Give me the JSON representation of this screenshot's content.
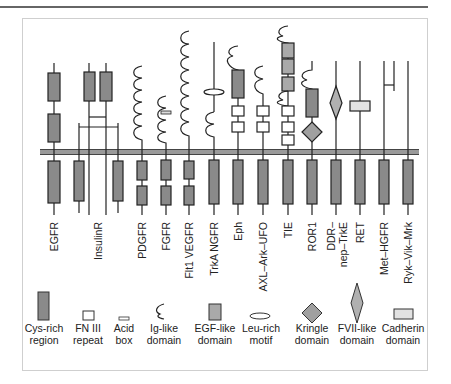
{
  "figure": {
    "title": "",
    "colors": {
      "cys_rich": "#8a8a8a",
      "egf_like": "#a9a9a9",
      "kringle": "#a0a0a0",
      "fvii_like": "#b0b0b0",
      "cadherin": "#e2e2e2",
      "membrane": "#7a7a7a",
      "line": "#222222"
    },
    "receptors": [
      {
        "name": "EGFR",
        "x": 54
      },
      {
        "name": "InsulinR",
        "x": 98
      },
      {
        "name": "PDGFR",
        "x": 142
      },
      {
        "name": "FGFR",
        "x": 166
      },
      {
        "name": "Flt1 VEGFR",
        "x": 189
      },
      {
        "name": "TrkA NGFR",
        "x": 214
      },
      {
        "name": "Eph",
        "x": 238
      },
      {
        "name": "AXL–Ark–UFO",
        "x": 263
      },
      {
        "name": "TIE",
        "x": 288
      },
      {
        "name": "ROR1",
        "x": 312
      },
      {
        "name": "DDR–\nnep–TrkE",
        "x": 336
      },
      {
        "name": "RET",
        "x": 360
      },
      {
        "name": "Met–HGFR",
        "x": 388
      },
      {
        "name": "Ryk–Vik–Mrk",
        "x": 408
      }
    ],
    "receptor_labels": {
      "egfr": "EGFR",
      "insulinr": "InsulinR",
      "pdgfr": "PDGFR",
      "fgfr": "FGFR",
      "flt1": "Flt1 VEGFR",
      "trka": "TrkA NGFR",
      "eph": "Eph",
      "axl": "AXL–Ark–UFO",
      "tie": "TIE",
      "ror1": "ROR1",
      "ddr_1": "DDR–",
      "ddr_2": "nep–TrkE",
      "ret": "RET",
      "met": "Met–HGFR",
      "ryk": "Ryk–Vik–Mrk"
    },
    "legend": [
      {
        "key": "cys",
        "line1": "Cys-rich",
        "line2": "region",
        "icon": "cys-rich-region-icon"
      },
      {
        "key": "fn3",
        "line1": "FN III",
        "line2": "repeat",
        "icon": "fn3-repeat-icon"
      },
      {
        "key": "acid",
        "line1": "Acid",
        "line2": "box",
        "icon": "acid-box-icon"
      },
      {
        "key": "ig",
        "line1": "Ig-like",
        "line2": "domain",
        "icon": "ig-like-domain-icon"
      },
      {
        "key": "egf",
        "line1": "EGF-like",
        "line2": "domain",
        "icon": "egf-like-domain-icon"
      },
      {
        "key": "leu",
        "line1": "Leu-rich",
        "line2": "motif",
        "icon": "leu-rich-motif-icon"
      },
      {
        "key": "kringle",
        "line1": "Kringle",
        "line2": "domain",
        "icon": "kringle-domain-icon"
      },
      {
        "key": "fvii",
        "line1": "FVII-like",
        "line2": "domain",
        "icon": "fvii-like-domain-icon"
      },
      {
        "key": "cadherin",
        "line1": "Cadherin",
        "line2": "domain",
        "icon": "cadherin-domain-icon"
      }
    ]
  }
}
